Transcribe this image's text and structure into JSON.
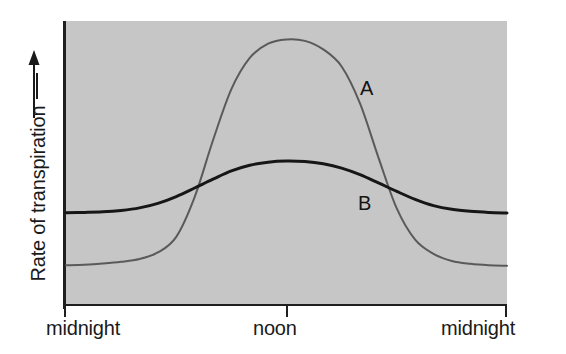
{
  "chart_data": {
    "type": "line",
    "title": "",
    "subtitle": "",
    "xlabel": "",
    "ylabel": "Rate of transpiration",
    "ylabel_suffix_icon": "arrow-right-dash",
    "y_axis_arrow": "up-arrow",
    "xlim": [
      0,
      24
    ],
    "ylim": [
      0,
      1
    ],
    "grid": false,
    "legend": "inline-curve-labels",
    "x_tick_labels": [
      "midnight",
      "noon",
      "midnight"
    ],
    "x_tick_values": [
      0,
      12,
      24
    ],
    "y_tick_labels": [],
    "plot_background_color": "#c6c6c6",
    "axis_color": "#1f1f1f",
    "annotations": [
      {
        "text": "A",
        "x": 16.4,
        "y": 0.7
      },
      {
        "text": "B",
        "x": 16.3,
        "y": 0.36
      }
    ],
    "series": [
      {
        "name": "A",
        "label": "A",
        "color": "#5a5a5a",
        "line_width": 2,
        "description": "Sharply peaked daytime transpiration curve; low flat at night, steep rise after dawn, broad high plateau around noon, steep fall before dusk.",
        "x": [
          0,
          1,
          2,
          3,
          4,
          5,
          6,
          7,
          8,
          9,
          10,
          11,
          12,
          13,
          14,
          15,
          16,
          17,
          18,
          19,
          20,
          21,
          22,
          23,
          24
        ],
        "y": [
          0.14,
          0.142,
          0.146,
          0.152,
          0.162,
          0.185,
          0.24,
          0.38,
          0.58,
          0.76,
          0.87,
          0.92,
          0.935,
          0.93,
          0.9,
          0.84,
          0.71,
          0.52,
          0.34,
          0.23,
          0.18,
          0.155,
          0.145,
          0.14,
          0.138
        ]
      },
      {
        "name": "B",
        "label": "B",
        "color": "#161616",
        "line_width": 3,
        "description": "Dampened transpiration curve; higher night baseline than A, gentle broad rise to a low midday maximum, gentle fall back to baseline.",
        "x": [
          0,
          1,
          2,
          3,
          4,
          5,
          6,
          7,
          8,
          9,
          10,
          11,
          12,
          13,
          14,
          15,
          16,
          17,
          18,
          19,
          20,
          21,
          22,
          23,
          24
        ],
        "y": [
          0.325,
          0.326,
          0.328,
          0.333,
          0.342,
          0.358,
          0.382,
          0.412,
          0.443,
          0.472,
          0.492,
          0.503,
          0.507,
          0.505,
          0.497,
          0.482,
          0.459,
          0.43,
          0.4,
          0.372,
          0.35,
          0.337,
          0.33,
          0.326,
          0.324
        ]
      }
    ],
    "crossings": [
      {
        "x": 5.8,
        "y": 0.372,
        "note": "A rises past B in the morning"
      },
      {
        "x": 18.2,
        "y": 0.398,
        "note": "A falls below B in the evening"
      }
    ]
  },
  "labels": {
    "y_axis": "Rate of transpiration",
    "x_left": "midnight",
    "x_center": "noon",
    "x_right": "midnight",
    "curve_a": "A",
    "curve_b": "B"
  }
}
